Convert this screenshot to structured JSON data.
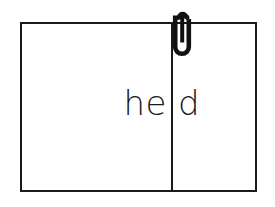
{
  "document": {
    "title": "Clipped page",
    "background_color": "#ffffff",
    "stroke_color": "#1a1a1a"
  },
  "page": {
    "border_color": "#1a1a1a",
    "fill_color": "#ffffff",
    "divider": {
      "name": "vertical-divider",
      "color": "#1a1a1a"
    },
    "panels": [
      {
        "id": "left-panel",
        "text": "he",
        "align": "right"
      },
      {
        "id": "right-panel",
        "text": "d",
        "align": "left"
      }
    ]
  },
  "clip": {
    "icon": "paperclip-icon",
    "color": "#111111",
    "label": "paperclip"
  }
}
